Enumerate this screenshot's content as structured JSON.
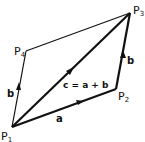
{
  "diagram": {
    "points": {
      "P1": {
        "label": "P",
        "sub": "1"
      },
      "P2": {
        "label": "P",
        "sub": "2"
      },
      "P3": {
        "label": "P",
        "sub": "3"
      },
      "P4": {
        "label": "P",
        "sub": "4"
      }
    },
    "vectors": {
      "a": "a",
      "b_left": "b",
      "b_right": "b",
      "c": "c = a + b"
    },
    "colors": {
      "stroke": "#111111",
      "background": "#ffffff"
    }
  }
}
